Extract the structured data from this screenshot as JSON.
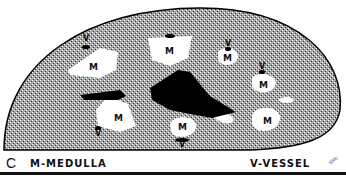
{
  "figure": {
    "panel_label": "C",
    "legend_left": "M-MEDULLA",
    "legend_right": "V-VESSEL",
    "signature": "SMc"
  },
  "labels": {
    "medulla": "M",
    "vessel": "V"
  },
  "colors": {
    "background": "#ffffff",
    "stipple": "#8a8a8a",
    "ink": "#000000"
  },
  "regions": [
    {
      "type": "medulla",
      "label": "M",
      "x": 94,
      "y": 67
    },
    {
      "type": "medulla",
      "label": "M",
      "x": 170,
      "y": 52
    },
    {
      "type": "medulla",
      "label": "M",
      "x": 228,
      "y": 58
    },
    {
      "type": "medulla",
      "label": "M",
      "x": 262,
      "y": 85
    },
    {
      "type": "medulla",
      "label": "M",
      "x": 116,
      "y": 118
    },
    {
      "type": "medulla",
      "label": "M",
      "x": 182,
      "y": 127
    },
    {
      "type": "medulla",
      "label": "M",
      "x": 265,
      "y": 120
    }
  ],
  "vessels": [
    {
      "label": "V",
      "x": 84,
      "y": 41
    },
    {
      "label": "V",
      "x": 225,
      "y": 43
    },
    {
      "label": "V",
      "x": 260,
      "y": 66
    },
    {
      "label": "V",
      "x": 98,
      "y": 131
    },
    {
      "label": "V",
      "x": 182,
      "y": 143
    }
  ]
}
